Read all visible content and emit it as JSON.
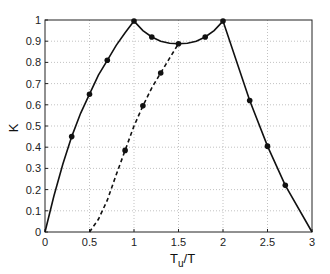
{
  "chart_data": {
    "type": "line",
    "title": "",
    "xlabel": "T_u/T",
    "ylabel": "K",
    "xlim": [
      0,
      3
    ],
    "ylim": [
      0,
      1
    ],
    "grid": true,
    "legend": null,
    "x_ticks": [
      "0",
      "0.5",
      "1",
      "1.5",
      "2",
      "2.5",
      "3"
    ],
    "y_ticks": [
      "0",
      "0.1",
      "0.2",
      "0.3",
      "0.4",
      "0.5",
      "0.6",
      "0.7",
      "0.8",
      "0.9",
      "1"
    ],
    "series": [
      {
        "name": "solid",
        "style": "solid",
        "curve": [
          [
            0,
            0
          ],
          [
            0.1,
            0.17
          ],
          [
            0.2,
            0.32
          ],
          [
            0.3,
            0.45
          ],
          [
            0.4,
            0.56
          ],
          [
            0.5,
            0.65
          ],
          [
            0.6,
            0.74
          ],
          [
            0.7,
            0.81
          ],
          [
            0.8,
            0.88
          ],
          [
            0.9,
            0.94
          ],
          [
            1.0,
            0.995
          ],
          [
            1.1,
            0.95
          ],
          [
            1.2,
            0.92
          ],
          [
            1.3,
            0.9
          ],
          [
            1.4,
            0.89
          ],
          [
            1.5,
            0.888
          ],
          [
            1.6,
            0.89
          ],
          [
            1.7,
            0.9
          ],
          [
            1.8,
            0.92
          ],
          [
            1.9,
            0.95
          ],
          [
            2.0,
            0.995
          ],
          [
            2.3,
            0.62
          ],
          [
            2.5,
            0.405
          ],
          [
            2.7,
            0.22
          ],
          [
            3.0,
            0
          ]
        ],
        "markers": [
          [
            0.3,
            0.45
          ],
          [
            0.5,
            0.65
          ],
          [
            0.7,
            0.81
          ],
          [
            1.0,
            0.995
          ],
          [
            1.2,
            0.92
          ],
          [
            1.5,
            0.888
          ],
          [
            1.8,
            0.92
          ],
          [
            2.0,
            0.995
          ],
          [
            2.3,
            0.62
          ],
          [
            2.5,
            0.405
          ],
          [
            2.7,
            0.22
          ]
        ]
      },
      {
        "name": "dashed",
        "style": "dashed",
        "curve": [
          [
            0.5,
            0
          ],
          [
            0.6,
            0.06
          ],
          [
            0.7,
            0.15
          ],
          [
            0.8,
            0.27
          ],
          [
            0.9,
            0.385
          ],
          [
            1.0,
            0.5
          ],
          [
            1.1,
            0.595
          ],
          [
            1.2,
            0.68
          ],
          [
            1.3,
            0.75
          ],
          [
            1.4,
            0.82
          ],
          [
            1.5,
            0.888
          ]
        ],
        "markers": [
          [
            0.9,
            0.385
          ],
          [
            1.1,
            0.595
          ],
          [
            1.3,
            0.75
          ]
        ]
      }
    ]
  },
  "axes": {
    "xlabel_main": "T",
    "xlabel_sub": "u",
    "xlabel_tail": "/T",
    "ylabel": "K"
  }
}
